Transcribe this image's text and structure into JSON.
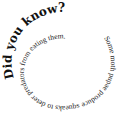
{
  "spiral": {
    "heading": "Did you know?",
    "body": "Some moth pupae produce squeaks to deter predators from eating them."
  },
  "colors": {
    "background": "#ffffff",
    "text": "#111111"
  }
}
